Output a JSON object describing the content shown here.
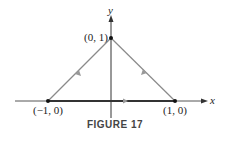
{
  "figure": {
    "caption": "FIGURE 17",
    "axes": {
      "x_label": "x",
      "y_label": "y"
    },
    "points": [
      {
        "label": "(0, 1)",
        "x": 0,
        "y": 1
      },
      {
        "label": "(−1, 0)",
        "x": -1,
        "y": 0
      },
      {
        "label": "(1, 0)",
        "x": 1,
        "y": 0
      }
    ],
    "path": {
      "description": "Triangle traversed counterclockwise: (-1,0) to (1,0) to (0,1) to (-1,0)",
      "colors": {
        "sides": "#8a8a8a",
        "base": "#333333",
        "axes": "#333333"
      }
    }
  }
}
